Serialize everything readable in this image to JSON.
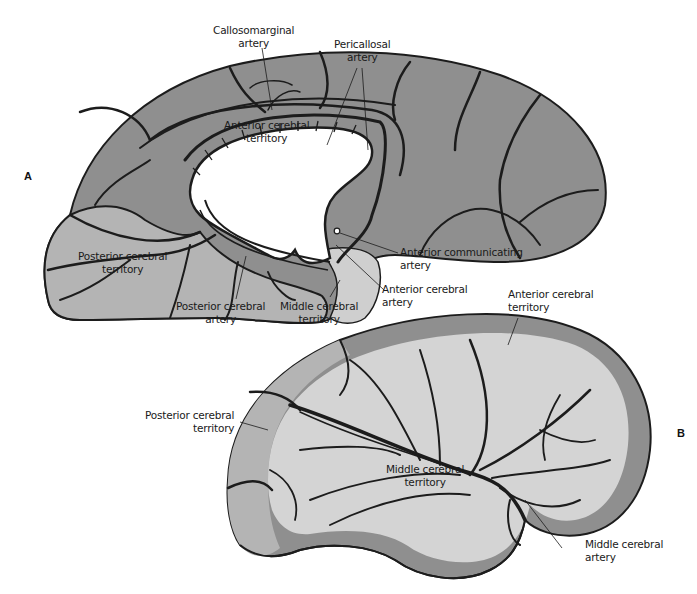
{
  "figure": {
    "panels": [
      {
        "id": "A",
        "label": "A"
      },
      {
        "id": "B",
        "label": "B"
      }
    ],
    "colors": {
      "anterior_territory": "#8f8f8f",
      "posterior_territory": "#b4b4b4",
      "middle_territory": "#d2d2d2",
      "middle_territory_lateral": "#d6d6d6",
      "vessel": "#1c1c1c",
      "ventricle": "#ffffff"
    },
    "panel_a": {
      "labels": {
        "callosomarginal": [
          "Callosomarginal",
          "artery"
        ],
        "pericallosal": [
          "Pericallosal",
          "artery"
        ],
        "anterior_territory": [
          "Anterior cerebral",
          "territory"
        ],
        "posterior_territory": [
          "Posterior cerebral",
          "territory"
        ],
        "posterior_artery": [
          "Posterior cerebral",
          "artery"
        ],
        "middle_territory": [
          "Middle cerebral",
          "territory"
        ],
        "anterior_communicating": [
          "Anterior communicating",
          "artery"
        ],
        "anterior_artery": [
          "Anterior cerebral",
          "artery"
        ]
      }
    },
    "panel_b": {
      "labels": {
        "anterior_territory": [
          "Anterior cerebral",
          "territory"
        ],
        "posterior_territory": [
          "Posterior cerebral",
          "territory"
        ],
        "middle_territory": [
          "Middle cerebral",
          "territory"
        ],
        "middle_artery": [
          "Middle cerebral",
          "artery"
        ]
      }
    }
  }
}
